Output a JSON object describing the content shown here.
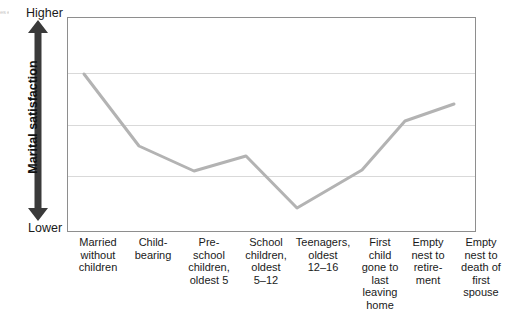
{
  "edge_artifact": "es\ne",
  "axis": {
    "y_title": "Marital satisfaction",
    "y_high_label": "Higher",
    "y_low_label": "Lower",
    "arrow_color": "#3a3a3a",
    "line_color": "#b3b3b3",
    "grid_color": "#d9d9d9",
    "border_color": "#8e8e8e"
  },
  "chart_data": {
    "type": "line",
    "title": "",
    "xlabel": "",
    "ylabel": "Marital satisfaction",
    "ylim": [
      0,
      100
    ],
    "ytick_labels": [
      "Lower",
      "Higher"
    ],
    "grid": true,
    "gridlines_y": [
      26,
      50,
      74
    ],
    "legend": "none",
    "categories": [
      "Married without children",
      "Child-bearing",
      "Pre-school children, oldest 5",
      "School children, oldest 5–12",
      "Teenagers, oldest 12–16",
      "First child gone to last leaving home",
      "Empty nest to retirement",
      "Empty nest to death of first spouse"
    ],
    "category_lines": [
      [
        "Married",
        "without",
        "children"
      ],
      [
        "Child-",
        "bearing"
      ],
      [
        "Pre-",
        "school",
        "children,",
        "oldest 5"
      ],
      [
        "School",
        "children,",
        "oldest",
        "5–12"
      ],
      [
        "Teenagers,",
        "oldest",
        "12–16"
      ],
      [
        "First",
        "child",
        "gone to",
        "last",
        "leaving",
        "home"
      ],
      [
        "Empty",
        "nest to",
        "retire-",
        "ment"
      ],
      [
        "Empty",
        "nest to",
        "death of",
        "first",
        "spouse"
      ]
    ],
    "values": [
      74,
      41,
      30,
      37,
      13,
      30,
      53,
      61
    ],
    "points_px": [
      {
        "x": 16,
        "y": 56
      },
      {
        "x": 71,
        "y": 128
      },
      {
        "x": 126,
        "y": 153
      },
      {
        "x": 178,
        "y": 138
      },
      {
        "x": 229,
        "y": 190
      },
      {
        "x": 294,
        "y": 152
      },
      {
        "x": 337,
        "y": 103
      },
      {
        "x": 386,
        "y": 86
      }
    ]
  },
  "x_label_layout": [
    {
      "left": 0,
      "width": 62
    },
    {
      "left": 58,
      "width": 56
    },
    {
      "left": 111,
      "width": 62
    },
    {
      "left": 168,
      "width": 62
    },
    {
      "left": 221,
      "width": 70
    },
    {
      "left": 286,
      "width": 54
    },
    {
      "left": 334,
      "width": 54
    },
    {
      "left": 385,
      "width": 58
    }
  ]
}
